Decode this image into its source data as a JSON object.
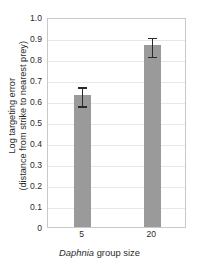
{
  "chart_data": {
    "type": "bar",
    "title": "",
    "categories": [
      "5",
      "20"
    ],
    "values": [
      0.63,
      0.865
    ],
    "errors": [
      0.045,
      0.045
    ],
    "error_low": [
      0.585,
      0.82
    ],
    "error_high": [
      0.675,
      0.91
    ],
    "series": [
      {
        "name": "Log targeting error",
        "values": [
          0.63,
          0.865
        ],
        "errors": [
          0.045,
          0.045
        ]
      }
    ],
    "xlabel_italic": "Daphnia",
    "xlabel_rest": " group size",
    "xlabel": "Daphnia group size",
    "ylabel_line1": "Log targeting error",
    "ylabel_line2": "(distance from strike to nearest prey)",
    "ylabel": "Log targeting error (distance from strike to nearest prey)",
    "ylim": [
      0,
      1.0
    ],
    "ytick_values": [
      1.0,
      0.9,
      0.8,
      0.7,
      0.6,
      0.5,
      0.4,
      0.3,
      0.2,
      0.1,
      0
    ],
    "ytick_labels": [
      "1.0",
      "0.9",
      "0.8",
      "0.7",
      "0.6",
      "0.5",
      "0.4",
      "0.3",
      "0.2",
      "0.1",
      "0"
    ],
    "grid": true,
    "legend": "none",
    "bar_color": "#9a9a9a",
    "error_color": "#2a2a2a",
    "grid_color": "#e8e8e8",
    "frame_color": "#c9c9c9"
  }
}
